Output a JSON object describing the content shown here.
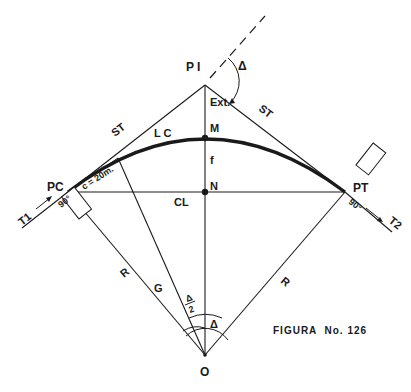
{
  "figure": {
    "caption": "FIGURA  No. 126",
    "colors": {
      "ink": "#1a1a1a",
      "background": "#ffffff"
    },
    "points": {
      "pi": "P I",
      "pc": "PC",
      "pt": "PT",
      "m": "M",
      "n": "N",
      "o": "O"
    },
    "labels": {
      "delta_top": "Δ",
      "ext": "Ext.",
      "st_left": "ST",
      "st_right": "ST",
      "lc": "L C",
      "f": "f",
      "cl": "CL",
      "r_left": "R",
      "r_right": "R",
      "g": "G",
      "delta_half_num": "Δ",
      "delta_half_den": "2",
      "delta_center": "Δ",
      "chord_c": "c = 20m.",
      "t1": "T1",
      "t2": "T2",
      "right_angle_pc": "90°",
      "right_angle_pt": "90°"
    }
  }
}
